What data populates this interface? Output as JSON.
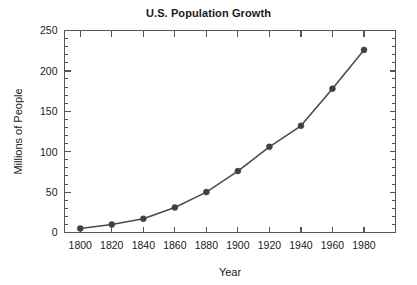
{
  "chart_data": {
    "type": "line",
    "title": "U.S. Population Growth",
    "xlabel": "Year",
    "ylabel": "Millions of People",
    "x": [
      1800,
      1820,
      1840,
      1860,
      1880,
      1900,
      1920,
      1940,
      1960,
      1980
    ],
    "values": [
      5,
      10,
      17,
      31,
      50,
      76,
      106,
      132,
      178,
      226
    ],
    "series": [
      {
        "name": "U.S. Population",
        "values": [
          5,
          10,
          17,
          31,
          50,
          76,
          106,
          132,
          178,
          226
        ]
      }
    ],
    "xlim": [
      1790,
      2000
    ],
    "ylim": [
      0,
      250
    ],
    "xticks": [
      1800,
      1820,
      1840,
      1860,
      1880,
      1900,
      1920,
      1940,
      1960,
      1980
    ],
    "xtick_labels": [
      "1800",
      "1820",
      "1840",
      "1860",
      "1880",
      "1900",
      "1920",
      "1940",
      "1960",
      "1980"
    ],
    "yticks": [
      0,
      50,
      100,
      150,
      200,
      250
    ],
    "ytick_labels": [
      "0",
      "50",
      "100",
      "150",
      "200",
      "250"
    ],
    "y_minor_step": 10,
    "grid": false,
    "legend": false,
    "marker": "circle",
    "line_color": "#4a4a52",
    "marker_color": "#3f3f47",
    "axis_color": "#555555",
    "background_color": "#ffffff"
  }
}
